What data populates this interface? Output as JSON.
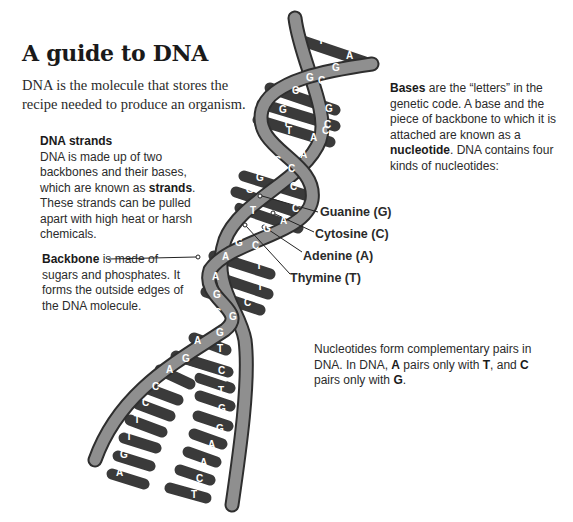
{
  "title": "A guide to DNA",
  "intro": "DNA is the molecule that stores the recipe needed to produce an organism.",
  "strands": {
    "heading": "DNA strands",
    "text_before": "DNA is made up of two backbones and their bases, which are known as ",
    "bold": "strands",
    "text_after": ". These strands can be pulled apart with high heat or harsh chemicals."
  },
  "backbone": {
    "bold": "Backbone",
    "text": " is made of sugars and phosphates. It forms the outside edges of the DNA molecule."
  },
  "bases": {
    "bold1": "Bases",
    "text1": " are the “letters” in the genetic code. A base and the piece of backbone to which it is attached are known as a ",
    "bold2": "nucleotide",
    "text2": ". DNA contains four kinds of nucleotides:"
  },
  "nucleotide_labels": [
    {
      "label": "Guanine (G)",
      "x": 310,
      "y": 213
    },
    {
      "label": "Cytosine (C)",
      "x": 305,
      "y": 235
    },
    {
      "label": "Adenine (A)",
      "x": 293,
      "y": 257
    },
    {
      "label": "Thymine (T)",
      "x": 280,
      "y": 279
    }
  ],
  "pairs": {
    "text1": "Nucleotides form complementary pairs in DNA. In DNA, ",
    "A": "A",
    "text2": " pairs only with ",
    "T": "T",
    "text3": ", and ",
    "C": "C",
    "text4": " pairs only with ",
    "G": "G",
    "text5": "."
  },
  "helix_bases": [
    {
      "l": "T",
      "x": 318,
      "y": 44
    },
    {
      "l": "A",
      "x": 346,
      "y": 59
    },
    {
      "l": "C",
      "x": 316,
      "y": 64
    },
    {
      "l": "G",
      "x": 332,
      "y": 71
    },
    {
      "l": "G",
      "x": 306,
      "y": 81
    },
    {
      "l": "C",
      "x": 318,
      "y": 84
    },
    {
      "l": "C",
      "x": 292,
      "y": 94
    },
    {
      "l": "G",
      "x": 325,
      "y": 112
    },
    {
      "l": "G",
      "x": 279,
      "y": 113
    },
    {
      "l": "C",
      "x": 322,
      "y": 134
    },
    {
      "l": "T",
      "x": 286,
      "y": 134
    },
    {
      "l": "C",
      "x": 324,
      "y": 128
    },
    {
      "l": "T",
      "x": 283,
      "y": 126
    },
    {
      "l": "A",
      "x": 310,
      "y": 141
    },
    {
      "l": "T",
      "x": 294,
      "y": 148
    },
    {
      "l": "A",
      "x": 300,
      "y": 158
    },
    {
      "l": "C",
      "x": 274,
      "y": 164
    },
    {
      "l": "C",
      "x": 288,
      "y": 172
    },
    {
      "l": "G",
      "x": 256,
      "y": 181
    },
    {
      "l": "C",
      "x": 290,
      "y": 190
    },
    {
      "l": "G",
      "x": 246,
      "y": 193
    },
    {
      "l": "C",
      "x": 292,
      "y": 212
    },
    {
      "l": "T",
      "x": 250,
      "y": 214
    },
    {
      "l": "A",
      "x": 280,
      "y": 224
    },
    {
      "l": "G",
      "x": 263,
      "y": 232
    },
    {
      "l": "G",
      "x": 235,
      "y": 246
    },
    {
      "l": "C",
      "x": 252,
      "y": 249
    },
    {
      "l": "A",
      "x": 222,
      "y": 260
    },
    {
      "l": "T",
      "x": 256,
      "y": 269
    },
    {
      "l": "A",
      "x": 212,
      "y": 280
    },
    {
      "l": "T",
      "x": 257,
      "y": 290
    },
    {
      "l": "G",
      "x": 213,
      "y": 298
    },
    {
      "l": "C",
      "x": 244,
      "y": 306
    },
    {
      "l": "C",
      "x": 214,
      "y": 316
    },
    {
      "l": "G",
      "x": 229,
      "y": 320
    },
    {
      "l": "C",
      "x": 204,
      "y": 331
    },
    {
      "l": "G",
      "x": 216,
      "y": 336
    },
    {
      "l": "A",
      "x": 194,
      "y": 344
    },
    {
      "l": "T",
      "x": 217,
      "y": 352
    },
    {
      "l": "G",
      "x": 182,
      "y": 362
    },
    {
      "l": "C",
      "x": 218,
      "y": 374
    },
    {
      "l": "A",
      "x": 166,
      "y": 373
    },
    {
      "l": "T",
      "x": 218,
      "y": 394
    },
    {
      "l": "C",
      "x": 152,
      "y": 390
    },
    {
      "l": "G",
      "x": 218,
      "y": 412
    },
    {
      "l": "C",
      "x": 142,
      "y": 406
    },
    {
      "l": "G",
      "x": 216,
      "y": 432
    },
    {
      "l": "T",
      "x": 134,
      "y": 423
    },
    {
      "l": "A",
      "x": 208,
      "y": 448
    },
    {
      "l": "T",
      "x": 126,
      "y": 440
    },
    {
      "l": "A",
      "x": 200,
      "y": 466
    },
    {
      "l": "G",
      "x": 120,
      "y": 458
    },
    {
      "l": "C",
      "x": 196,
      "y": 482
    },
    {
      "l": "A",
      "x": 116,
      "y": 476
    },
    {
      "l": "T",
      "x": 191,
      "y": 498
    }
  ],
  "colors": {
    "backbone": "#8a8a8a",
    "backbone_edge": "#333333",
    "base_dark": "#2e2e2e",
    "base_mid": "#555555",
    "bond": "#ffffff"
  }
}
